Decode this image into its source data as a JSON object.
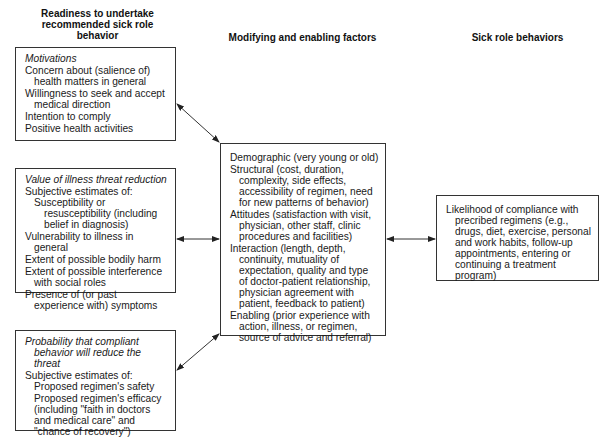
{
  "headings": {
    "readiness": "Readiness to undertake recommended sick role behavior",
    "modifying": "Modifying and enabling factors",
    "sick_role": "Sick role behaviors"
  },
  "motivations": {
    "title": "Motivations",
    "items": [
      "Concern about (salience of) health matters in general",
      "Willingness to seek and accept medical direction",
      "Intention to comply",
      "Positive health activities"
    ]
  },
  "value_threat": {
    "title": "Value of illness threat reduction",
    "intro": "Subjective estimates of:",
    "sub_items": [
      "Susceptibility or resusceptibility (including belief in diagnosis)"
    ],
    "items": [
      "Vulnerability to illness in general",
      "Extent of possible bodily harm",
      "Extent of possible interference with social roles",
      "Presence of (or past experience with) symptoms"
    ]
  },
  "probability": {
    "title": "Probability that compliant behavior will reduce the threat",
    "intro": "Subjective estimates of:",
    "sub_items": [
      "Proposed regimen's safety",
      "Proposed regimen's efficacy (including \"faith in doctors and medical care\" and \"chance of recovery\")"
    ]
  },
  "modifying_factors": {
    "items": [
      "Demographic (very young or old)",
      "Structural (cost, duration, complexity, side effects, accessibility of regimen, need for new patterns of behavior)",
      "Attitudes (satisfaction with visit, physician, other staff, clinic procedures and facilities)",
      "Interaction (length, depth, continuity, mutuality of expectation, quality and type of doctor-patient relationship, physician agreement with patient, feedback to patient)",
      "Enabling (prior experience with action, illness, or regimen, source of advice and referral)"
    ]
  },
  "sick_role_behaviors": {
    "items": [
      "Likelihood of compliance with precribed regimens (e.g., drugs, diet, exercise, personal and work habits, follow-up appointments, entering or continuing a treatment program)"
    ]
  }
}
